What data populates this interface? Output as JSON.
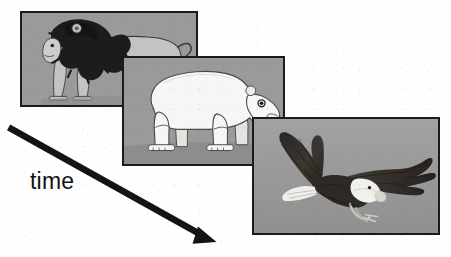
{
  "figure": {
    "caption": "time",
    "background_color": "#fefefe",
    "frame_border_color": "#1b1b1b",
    "photo_background_color": "#9a9a9a",
    "arrow": {
      "name": "time-arrow",
      "color": "#141414",
      "direction": "down-right",
      "start": [
        11,
        16
      ],
      "end": [
        214,
        130
      ]
    },
    "panels": [
      {
        "id": "panel-lion",
        "subject": "lion",
        "subject_label": "lion",
        "style": "illustration",
        "order": 1,
        "colors": {
          "background": "#9a9a9a",
          "body": "#c2c2c2",
          "mane": "#1c1c1c",
          "shadow": "#4a4a4a",
          "outline": "#2a2a2a"
        }
      },
      {
        "id": "panel-polar-bear",
        "subject": "polar bear",
        "subject_label": "polar bear",
        "style": "illustration",
        "order": 2,
        "colors": {
          "background": "#9a9a9a",
          "body": "#f4f4f2",
          "outline": "#3a3a3a",
          "eye": "#141414"
        }
      },
      {
        "id": "panel-bald-eagle",
        "subject": "bald eagle",
        "subject_label": "bald eagle",
        "style": "photograph",
        "order": 3,
        "colors": {
          "background": "#9a9a9a",
          "body": "#2e2a26",
          "head": "#efefec",
          "beak": "#d8d4cc"
        }
      }
    ]
  }
}
